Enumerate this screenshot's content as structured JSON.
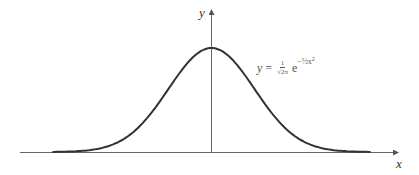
{
  "chart_data": {
    "type": "line",
    "title": "",
    "xlabel": "x",
    "ylabel": "y",
    "series": [
      {
        "name": "standard normal density",
        "formula": "y = (1/√(2π)) e^(-½x²)",
        "x": [
          -3.5,
          -3,
          -2.5,
          -2,
          -1.5,
          -1,
          -0.5,
          0,
          0.5,
          1,
          1.5,
          2,
          2.5,
          3,
          3.5
        ],
        "values": [
          0.0009,
          0.0044,
          0.0175,
          0.054,
          0.1295,
          0.242,
          0.3521,
          0.3989,
          0.3521,
          0.242,
          0.1295,
          0.054,
          0.0175,
          0.0044,
          0.0009
        ]
      }
    ],
    "annotations": [
      "y = 1/√(2π) e^(-½x²)"
    ],
    "xlim": [
      -4.2,
      4.2
    ],
    "ylim": [
      0,
      0.6
    ],
    "grid": false,
    "legend": "none",
    "axis_ticks": "none"
  },
  "axes": {
    "x_label": "x",
    "y_label": "y"
  },
  "equation": {
    "lhs": "y",
    "equals": "=",
    "frac_num": "1",
    "frac_den": "√2π",
    "base": "e",
    "exponent": "−½x",
    "exponent_power": "2"
  },
  "colors": {
    "curve": "#333333",
    "axis": "#555555",
    "text": "#444444"
  }
}
